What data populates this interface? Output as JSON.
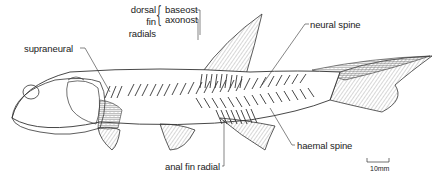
{
  "figure": {
    "labels": {
      "dorsal_fin_radials_group": [
        "dorsal",
        "fin",
        "radials"
      ],
      "baseost": "baseost",
      "axonost": "axonost",
      "neural_spine": "neural spine",
      "supraneural": "supraneural",
      "haemal_spine": "haemal spine",
      "anal_fin_radial": "anal fin radial"
    },
    "scale_bar": {
      "label": "10mm"
    }
  },
  "colors": {
    "ink": "#222222",
    "background": "#ffffff",
    "fin_fill": "#d9d9d9",
    "scale_fill": "#bfbfbf"
  }
}
